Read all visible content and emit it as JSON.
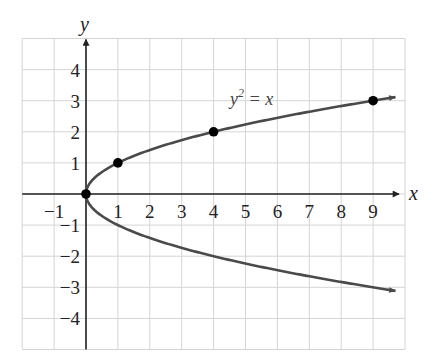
{
  "chart_data": {
    "type": "line",
    "title": "",
    "equation_label": "y² = x",
    "equation_parts": {
      "base": "y",
      "exponent": "2",
      "rest": " = x"
    },
    "xlabel": "x",
    "ylabel": "y",
    "xlim": [
      -2,
      10
    ],
    "ylim": [
      -5,
      5
    ],
    "grid": true,
    "x_ticks": [
      -1,
      1,
      2,
      3,
      4,
      5,
      6,
      7,
      8,
      9
    ],
    "y_ticks": [
      4,
      3,
      2,
      1,
      -1,
      -2,
      -3,
      -4
    ],
    "x_tick_labels": [
      "−1",
      "1",
      "2",
      "3",
      "4",
      "5",
      "6",
      "7",
      "8",
      "9"
    ],
    "y_tick_labels": [
      "4",
      "3",
      "2",
      "1",
      "−1",
      "−2",
      "−3",
      "−4"
    ],
    "series": [
      {
        "name": "y = √x (upper branch)",
        "function": "y^2 = x",
        "x_range": [
          0,
          9.7
        ]
      },
      {
        "name": "y = −√x (lower branch)",
        "function": "y^2 = x",
        "x_range": [
          0,
          9.7
        ]
      }
    ],
    "points": [
      {
        "x": 0,
        "y": 0
      },
      {
        "x": 1,
        "y": 1
      },
      {
        "x": 4,
        "y": 2
      },
      {
        "x": 9,
        "y": 3
      }
    ]
  },
  "colors": {
    "grid": "#d4d4d4",
    "axis": "#222222",
    "curve": "#4a4a4a",
    "point": "#000000",
    "background": "#ffffff"
  }
}
